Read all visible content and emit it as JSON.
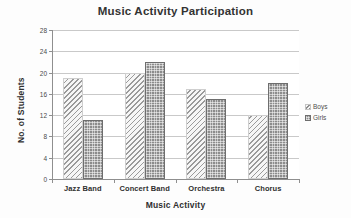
{
  "chart_data": {
    "type": "bar",
    "title": "Music Activity Participation",
    "xlabel": "Music Activity",
    "ylabel": "No. of Students",
    "categories": [
      "Jazz Band",
      "Concert Band",
      "Orchestra",
      "Chorus"
    ],
    "series": [
      {
        "name": "Boys",
        "values": [
          19,
          20,
          17,
          12
        ],
        "fill": "diagonal-hatch",
        "color": "#9a9a9a"
      },
      {
        "name": "Girls",
        "values": [
          11,
          22,
          15,
          18
        ],
        "fill": "dotted-grid",
        "color": "#8c8c8c"
      }
    ],
    "ylim": [
      0,
      28
    ],
    "yticks": [
      0,
      4,
      8,
      12,
      16,
      20,
      24,
      28
    ],
    "ytick_labels": [
      "0",
      "4",
      "8",
      "12",
      "16",
      "20",
      "24",
      "28"
    ],
    "grid": true,
    "grid_axis": "y",
    "legend_position": "right",
    "background": "#ffffff",
    "axis_color": "#8f8f8f",
    "grid_color": "#c9c9c9"
  },
  "legend": {
    "entries": [
      {
        "label": "Boys"
      },
      {
        "label": "Girls"
      }
    ]
  }
}
